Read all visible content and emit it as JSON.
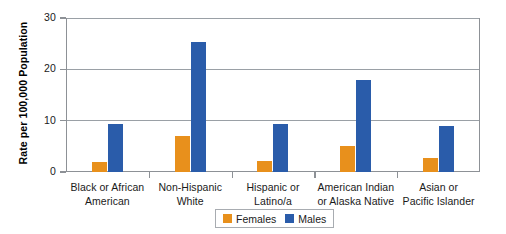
{
  "chart_data": {
    "type": "bar",
    "title": "",
    "xlabel": "",
    "ylabel": "Rate per 100,000 Population",
    "ylim": [
      0,
      30
    ],
    "yticks": [
      0,
      10,
      20,
      30
    ],
    "ytick_labels": [
      "0",
      "10",
      "20",
      "30"
    ],
    "grid": true,
    "legend_position": "bottom-center",
    "categories": [
      "Black or African American",
      "Non-Hispanic White",
      "Hispanic or Latino/a",
      "American Indian or Alaska Native",
      "Asian or Pacific Islander"
    ],
    "category_lines": [
      [
        "Black or African",
        "American"
      ],
      [
        "Non-Hispanic",
        "White"
      ],
      [
        "Hispanic or",
        "Latino/a"
      ],
      [
        "American Indian",
        "or Alaska Native"
      ],
      [
        "Asian or",
        "Pacific Islander"
      ]
    ],
    "series": [
      {
        "name": "Females",
        "color": "#e8901c",
        "values": [
          2.0,
          7.0,
          2.2,
          5.0,
          2.8
        ]
      },
      {
        "name": "Males",
        "color": "#2a5caa",
        "values": [
          9.4,
          25.3,
          9.3,
          18.0,
          9.0
        ]
      }
    ]
  },
  "legend": {
    "items": [
      {
        "label": "Females",
        "color": "#e8901c"
      },
      {
        "label": "Males",
        "color": "#2a5caa"
      }
    ]
  },
  "colors": {
    "female": "#e8901c",
    "male": "#2a5caa",
    "axis": "#8d9196",
    "grid": "#9aa0a6",
    "text": "#1a1a1a",
    "background": "#ffffff"
  }
}
